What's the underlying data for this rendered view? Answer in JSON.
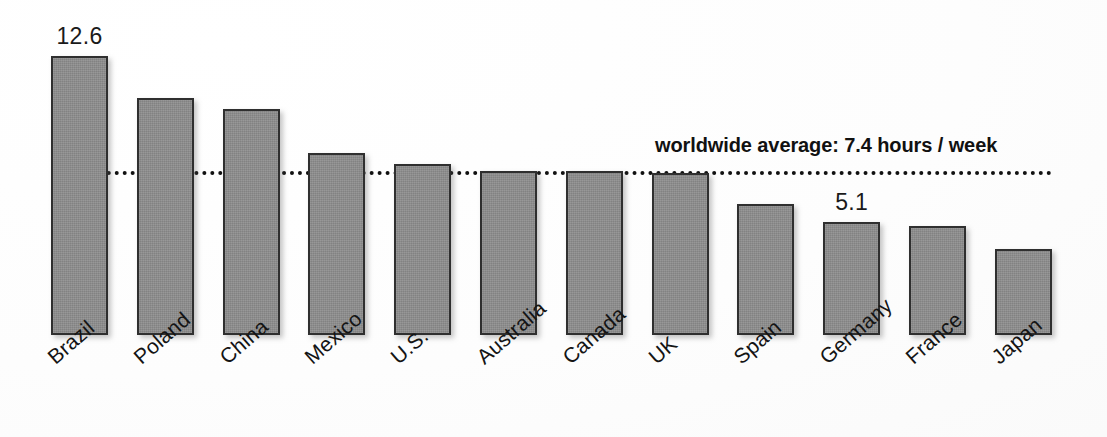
{
  "chart_data": {
    "type": "bar",
    "title": "",
    "subtitle": "",
    "xlabel": "",
    "ylabel": "",
    "unit": "hours / week",
    "categories": [
      "Brazil",
      "Poland",
      "China",
      "Mexico",
      "U.S.",
      "Australia",
      "Canada",
      "UK",
      "Spain",
      "Germany",
      "France",
      "Japan"
    ],
    "values": [
      12.6,
      10.7,
      10.2,
      8.2,
      7.7,
      7.4,
      7.4,
      7.3,
      5.9,
      5.1,
      4.9,
      3.9
    ],
    "value_labels": [
      {
        "category": "Brazil",
        "text": "12.6"
      },
      {
        "category": "Germany",
        "text": "5.1"
      }
    ],
    "ylim": [
      0,
      13.5
    ],
    "grid": false,
    "legend": false,
    "reference_line": {
      "value": 7.4,
      "label": "worldwide average: 7.4 hours / week",
      "style": "dotted"
    },
    "bar_color": "#8c8c8c",
    "bar_border_color": "#2f2f2f",
    "text_color": "#141414"
  }
}
